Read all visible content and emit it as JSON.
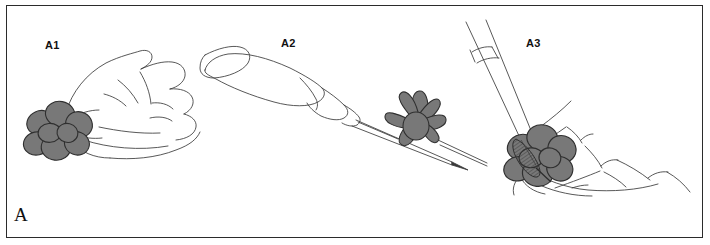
{
  "figure": {
    "label": "A",
    "panels": [
      {
        "id": "A1",
        "label": "A1"
      },
      {
        "id": "A2",
        "label": "A2"
      },
      {
        "id": "A3",
        "label": "A3"
      }
    ]
  },
  "colors": {
    "background": "#ffffff",
    "border": "#2b2b2b",
    "ink": "#333333",
    "tissue_fill": "#787878",
    "tissue_fill_dark": "#6a6a6a",
    "tissue_fill_light": "#8d8d8d",
    "label_text": "#111111"
  },
  "illustration": {
    "style": "line-art-medical-illustration",
    "panel_a1": {
      "description": "hand holding lobular tissue specimen between fingers",
      "elements": [
        "hand-outline",
        "tissue-specimen",
        "finger-creases"
      ]
    },
    "panel_a2": {
      "description": "handheld instrument with long thin blade passing through lobular tissue specimen",
      "elements": [
        "instrument-handle",
        "instrument-ferrule",
        "instrument-blade",
        "tissue-specimen"
      ]
    },
    "panel_a3": {
      "description": "needle instrument with hatched tip contacting tissue specimen held in hand",
      "elements": [
        "needle-shaft",
        "needle-collar",
        "hatched-tip",
        "tissue-specimen",
        "hand-outline"
      ]
    }
  }
}
